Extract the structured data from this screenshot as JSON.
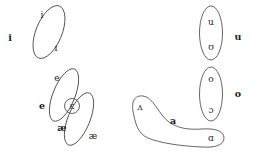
{
  "diagram": {
    "background_color": "#ffffff",
    "stroke_color": "#4a4a4a",
    "symbol_color": "#262626",
    "label_color": "#1a1a1a",
    "groups": [
      {
        "id": "group-i",
        "label": "i",
        "label_x": 10,
        "label_y": 38,
        "shape": "ellipse",
        "cx": 49,
        "cy": 32,
        "rx": 13,
        "ry": 28,
        "rotation": 22,
        "members": [
          {
            "symbol": "i",
            "x": 42,
            "y": 15
          },
          {
            "symbol": "ɪ",
            "x": 56,
            "y": 48
          }
        ]
      },
      {
        "id": "group-e",
        "label": "e",
        "label_x": 42,
        "label_y": 106,
        "shape": "ellipse",
        "cx": 64,
        "cy": 95,
        "rx": 11,
        "ry": 28,
        "rotation": 22,
        "members": [
          {
            "symbol": "e",
            "x": 57,
            "y": 78
          }
        ]
      },
      {
        "id": "group-ae",
        "label": "æ",
        "label_x": 62,
        "label_y": 128,
        "shape": "ellipse",
        "cx": 79,
        "cy": 119,
        "rx": 11,
        "ry": 28,
        "rotation": 22,
        "members": [
          {
            "symbol": "æ",
            "x": 93,
            "y": 136
          }
        ]
      },
      {
        "id": "group-epsilon-overlap",
        "label": "",
        "shape": "circle",
        "cx": 72,
        "cy": 106,
        "r": 7.5,
        "members": [
          {
            "symbol": "ɛ",
            "x": 72,
            "y": 106
          }
        ]
      },
      {
        "id": "group-u",
        "label": "u",
        "label_x": 238,
        "label_y": 37,
        "shape": "ellipse",
        "cx": 211,
        "cy": 33,
        "rx": 11.5,
        "ry": 27,
        "rotation": 0,
        "members": [
          {
            "symbol": "u",
            "x": 211,
            "y": 22
          },
          {
            "symbol": "ʊ",
            "x": 211,
            "y": 47
          }
        ]
      },
      {
        "id": "group-o",
        "label": "o",
        "label_x": 238,
        "label_y": 94,
        "shape": "ellipse",
        "cx": 211,
        "cy": 94,
        "rx": 11.5,
        "ry": 27,
        "rotation": 0,
        "members": [
          {
            "symbol": "o",
            "x": 211,
            "y": 79
          },
          {
            "symbol": "ɔ",
            "x": 211,
            "y": 110
          }
        ]
      },
      {
        "id": "group-a",
        "label": "a",
        "label_x": 173,
        "label_y": 121,
        "shape": "banana",
        "members": [
          {
            "symbol": "ʌ",
            "x": 140,
            "y": 107
          },
          {
            "symbol": "ɑ",
            "x": 211,
            "y": 138
          }
        ]
      }
    ]
  }
}
